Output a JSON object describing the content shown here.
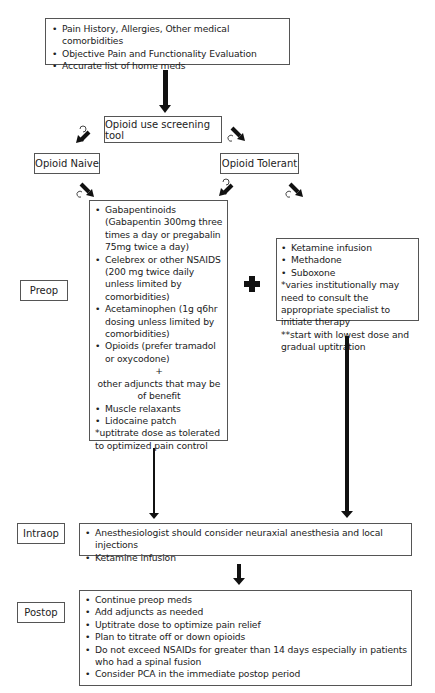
{
  "assessment": {
    "items": [
      "Pain History, Allergies, Other medical comorbidities",
      "Objective Pain and Functionality Evaluation",
      "Accurate list of home meds"
    ]
  },
  "screening": {
    "label": "Opioid use screening tool"
  },
  "branches": {
    "naive": {
      "label": "Opioid Naive"
    },
    "tolerant": {
      "label": "Opioid Tolerant"
    }
  },
  "phases": {
    "preop": "Preop",
    "intraop": "Intraop",
    "postop": "Postop"
  },
  "preop_naive": {
    "items": [
      "Gabapentinoids (Gabapentin 300mg three times a day or pregabalin 75mg twice a day)",
      "Celebrex or other NSAIDS (200 mg twice daily unless limited by comorbidities)",
      "Acetaminophen (1g q6hr dosing unless limited by comorbidities)",
      "Opioids (prefer tramadol or oxycodone)"
    ],
    "plus": "+",
    "adjuncts_heading": "other adjuncts that may be of benefit",
    "adjuncts": [
      "Muscle relaxants",
      "Lidocaine patch"
    ],
    "note": "*uptitrate dose as tolerated to optimized pain control"
  },
  "combine_symbol": "plus-sign",
  "preop_tolerant": {
    "items": [
      "Ketamine infusion",
      "Methadone",
      "Suboxone"
    ],
    "notes": [
      "*varies institutionally may need to consult the appropriate specialist to initiate therapy",
      "**start with lowest dose and gradual uptitration"
    ]
  },
  "intraop": {
    "items": [
      "Anesthesiologist should consider neuraxial anesthesia and local injections",
      "Ketamine infusion"
    ]
  },
  "postop": {
    "items": [
      "Continue preop meds",
      "Add adjuncts as needed",
      "Uptitrate dose to optimize pain relief",
      "Plan to titrate off or down opioids",
      "Do not exceed NSAIDs for greater than 14 days especially in patients who had a spinal fusion",
      "Consider PCA in the immediate postop period"
    ]
  },
  "colors": {
    "line": "#111111",
    "border": "#555555",
    "text": "#222222"
  }
}
